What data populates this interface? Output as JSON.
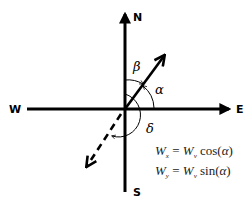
{
  "directions": {
    "north": "N",
    "south": "S",
    "east": "E",
    "west": "W"
  },
  "angles": {
    "alpha": "α",
    "beta": "β",
    "delta": "δ"
  },
  "equations": [
    {
      "lhs": "W",
      "lhs_sub": "x",
      "eq": " = ",
      "rhs": "W",
      "rhs_sub": "v",
      "fn": " cos(",
      "arg": "α",
      "close": ")"
    },
    {
      "lhs": "W",
      "lhs_sub": "y",
      "eq": " = ",
      "rhs": "W",
      "rhs_sub": "v",
      "fn": " sin(",
      "arg": "α",
      "close": ")"
    }
  ]
}
